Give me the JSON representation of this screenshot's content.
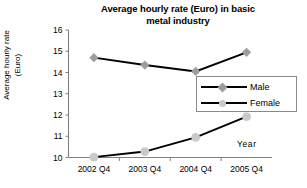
{
  "chart_data": {
    "type": "line",
    "title": "Average hourly rate (Euro) in basic metal industry",
    "title_line1": "Average hourly rate (Euro) in basic",
    "title_line2": "metal industry",
    "xlabel": "Year",
    "ylabel": "Average hourly rate (Euro)",
    "ylabel_line1": "Average hourly rate",
    "ylabel_line2": "(Euro)",
    "categories": [
      "2002 Q4",
      "2003 Q4",
      "2004 Q4",
      "2005 Q4"
    ],
    "ylim": [
      10,
      16
    ],
    "yticks": [
      "10",
      "11",
      "12",
      "13",
      "14",
      "15",
      "16"
    ],
    "grid": false,
    "legend_position": "center-right",
    "series": [
      {
        "name": "Male",
        "values": [
          14.7,
          14.35,
          14.05,
          14.95
        ],
        "marker": "diamond",
        "marker_color": "#9d9d9d",
        "line_color": "#000000"
      },
      {
        "name": "Female",
        "values": [
          10.02,
          10.28,
          10.95,
          11.92
        ],
        "marker": "circle",
        "marker_color": "#c9c9c9",
        "line_color": "#000000"
      }
    ]
  },
  "legend": {
    "items": [
      {
        "label": "Male"
      },
      {
        "label": "Female"
      }
    ]
  },
  "axes": {
    "axis_color": "#808080"
  }
}
